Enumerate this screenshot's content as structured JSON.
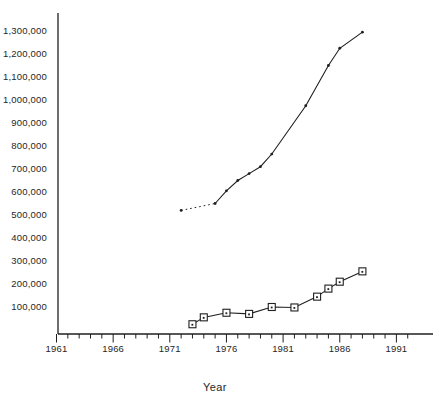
{
  "figure": {
    "background": "#ffffff",
    "ink_color": "#1f1f1f",
    "text_color": "#262626"
  },
  "chart_data": {
    "type": "line",
    "title": "",
    "xlabel": "Year",
    "ylabel": "",
    "legend": "none",
    "grid": false,
    "x_axis": {
      "unit": "year",
      "axis_range_shown": [
        1961,
        1994
      ],
      "minor_tick_step_years": 1,
      "major_tick_step_years": 5,
      "first_tick_year": 1961,
      "last_tick_year": 1992,
      "major_tick_years": [
        1961,
        1966,
        1971,
        1976,
        1981,
        1986,
        1991
      ],
      "major_tick_labels": [
        "1961",
        "1966",
        "1971",
        "1976",
        "1981",
        "1986",
        "1991"
      ]
    },
    "y_axis": {
      "value_range": [
        0,
        1350000
      ],
      "has_tick_marks": false,
      "ticks": [
        {
          "v": 100000,
          "label": "100,000"
        },
        {
          "v": 200000,
          "label": "200,000"
        },
        {
          "v": 300000,
          "label": "300,000"
        },
        {
          "v": 400000,
          "label": "400,000"
        },
        {
          "v": 500000,
          "label": "500,000"
        },
        {
          "v": 600000,
          "label": "600,000"
        },
        {
          "v": 700000,
          "label": "700,000"
        },
        {
          "v": 800000,
          "label": "800,000"
        },
        {
          "v": 900000,
          "label": "900,000"
        },
        {
          "v": 1000000,
          "label": "1,000,000"
        },
        {
          "v": 1100000,
          "label": "1,100,000"
        },
        {
          "v": 1200000,
          "label": "1,200,000"
        },
        {
          "v": 1300000,
          "label": "1,300,000"
        }
      ]
    },
    "series": [
      {
        "id": "upper-line",
        "marker": "dot",
        "line": "solid",
        "leading_segment_style": "dotted",
        "points": [
          {
            "year": 1972,
            "value": 520000
          },
          {
            "year": 1975,
            "value": 550000
          },
          {
            "year": 1976,
            "value": 605000
          },
          {
            "year": 1977,
            "value": 650000
          },
          {
            "year": 1978,
            "value": 680000
          },
          {
            "year": 1979,
            "value": 710000
          },
          {
            "year": 1980,
            "value": 765000
          },
          {
            "year": 1983,
            "value": 975000
          },
          {
            "year": 1985,
            "value": 1150000
          },
          {
            "year": 1986,
            "value": 1225000
          },
          {
            "year": 1988,
            "value": 1295000
          }
        ]
      },
      {
        "id": "lower-line",
        "marker": "open-square",
        "line": "solid",
        "leading_segment_style": "solid",
        "points": [
          {
            "year": 1973,
            "value": 25000
          },
          {
            "year": 1974,
            "value": 55000
          },
          {
            "year": 1976,
            "value": 75000
          },
          {
            "year": 1978,
            "value": 70000
          },
          {
            "year": 1980,
            "value": 100000
          },
          {
            "year": 1982,
            "value": 98000
          },
          {
            "year": 1984,
            "value": 145000
          },
          {
            "year": 1985,
            "value": 180000
          },
          {
            "year": 1986,
            "value": 210000
          },
          {
            "year": 1988,
            "value": 255000
          }
        ]
      }
    ]
  }
}
